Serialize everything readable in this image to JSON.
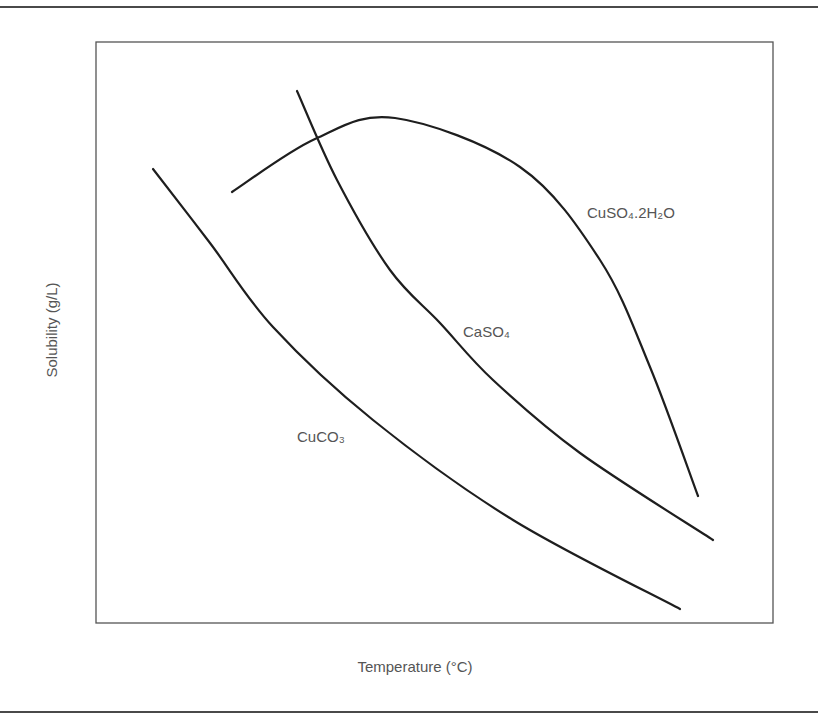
{
  "chart_data": {
    "type": "line",
    "title": "",
    "xlabel": "Temperature (°C)",
    "ylabel": "Solubility (g/L)",
    "grid": false,
    "ticks": "none",
    "legend": "inline labels",
    "series": [
      {
        "name": "CuSO4.2H2O",
        "label": "CuSO₄.2H₂O",
        "trend": "rises to a maximum then falls steeply",
        "points_px": [
          [
            232,
            192
          ],
          [
            315,
            139
          ],
          [
            395,
            118
          ],
          [
            520,
            167
          ],
          [
            600,
            260
          ],
          [
            650,
            367
          ],
          [
            698,
            496
          ]
        ]
      },
      {
        "name": "CaSO4",
        "label": "CaSO₄",
        "trend": "decreasing",
        "points_px": [
          [
            297,
            91
          ],
          [
            337,
            180
          ],
          [
            390,
            270
          ],
          [
            440,
            323
          ],
          [
            493,
            380
          ],
          [
            580,
            453
          ],
          [
            713,
            540
          ]
        ]
      },
      {
        "name": "CuCO3",
        "label": "CuCO₃",
        "trend": "decreasing",
        "points_px": [
          [
            153,
            169
          ],
          [
            210,
            243
          ],
          [
            273,
            327
          ],
          [
            373,
            420
          ],
          [
            513,
            520
          ],
          [
            680,
            609
          ]
        ]
      }
    ]
  },
  "labels": {
    "xlabel": "Temperature (°C)",
    "ylabel": "Solubility (g/L)",
    "cuso4": "CuSO₄.2H₂O",
    "caso4": "CaSO₄",
    "cuco3": "CuCO₃"
  }
}
